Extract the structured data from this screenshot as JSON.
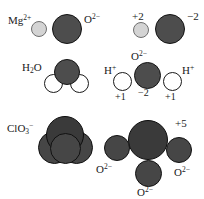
{
  "figure": {
    "background": "#ffffff",
    "colors": {
      "cation_light": "#d4d4d4",
      "oxygen_dark": "#4d4d4d",
      "chlorine_dark": "#3a3a3a",
      "hydrogen_white": "#ffffff",
      "outline": "#131313",
      "text": "#1a1a1a"
    },
    "rows": [
      {
        "id": "magnesium-oxide",
        "model": {
          "formula_label": "Mg",
          "formula_sup": "2+",
          "anion_label": "O",
          "anion_sup": "2−"
        },
        "exploded": {
          "cation_charge": "+2",
          "anion_charge": "−2"
        }
      },
      {
        "id": "water",
        "model": {
          "formula_label": "H",
          "formula_sub": "2",
          "formula_tail": "O"
        },
        "exploded": {
          "oxygen_label": "O",
          "oxygen_sup": "2−",
          "hydrogen_left_label": "H",
          "hydrogen_left_sup": "+",
          "hydrogen_right_label": "H",
          "hydrogen_right_sup": "+",
          "hydrogen_left_charge": "+1",
          "oxygen_charge": "−2",
          "hydrogen_right_charge": "+1"
        }
      },
      {
        "id": "chlorate",
        "model": {
          "formula_label": "ClO",
          "formula_sub": "3",
          "formula_sup": "−"
        },
        "exploded": {
          "chlorine_charge": "+5",
          "oxygen_left_label": "O",
          "oxygen_left_sup": "2−",
          "oxygen_right_label": "O",
          "oxygen_right_sup": "2−",
          "oxygen_bottom_label": "O",
          "oxygen_bottom_sup": "2−"
        }
      }
    ]
  }
}
